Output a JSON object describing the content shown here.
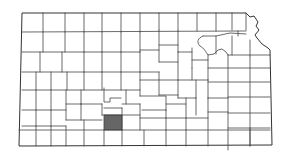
{
  "map": {
    "title": "Kansas county locator map",
    "state": "Kansas",
    "highlighted_county": "Kiowa County",
    "colors": {
      "background": "#ffffff",
      "county_fill": "#ffffff",
      "border": "#444444",
      "highlight_fill": "#666666"
    }
  }
}
